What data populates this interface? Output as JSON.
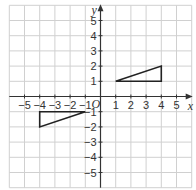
{
  "figure": {
    "type": "coordinate-grid",
    "x_axis_label": "x",
    "y_axis_label": "y",
    "origin_label": "O",
    "x_range": [
      -6,
      6
    ],
    "y_range": [
      -6,
      6
    ],
    "x_tick_labels": [
      "−5",
      "−4",
      "−3",
      "−2",
      "−1",
      "1",
      "2",
      "3",
      "4",
      "5"
    ],
    "x_tick_values": [
      -5,
      -4,
      -3,
      -2,
      -1,
      1,
      2,
      3,
      4,
      5
    ],
    "y_tick_labels": [
      "5",
      "4",
      "3",
      "2",
      "1",
      "−1",
      "−2",
      "−3",
      "−4",
      "−5"
    ],
    "y_tick_values": [
      5,
      4,
      3,
      2,
      1,
      -1,
      -2,
      -3,
      -4,
      -5
    ],
    "grid_color": "#d0d0d0",
    "axis_color": "#333333",
    "shape_color": "#222222"
  },
  "shapes": [
    {
      "name": "triangle-A",
      "vertices": [
        [
          1,
          1
        ],
        [
          4,
          1
        ],
        [
          4,
          2
        ]
      ]
    },
    {
      "name": "triangle-B",
      "vertices": [
        [
          -4,
          -1
        ],
        [
          -1,
          -1
        ],
        [
          -4,
          -2
        ]
      ]
    }
  ]
}
